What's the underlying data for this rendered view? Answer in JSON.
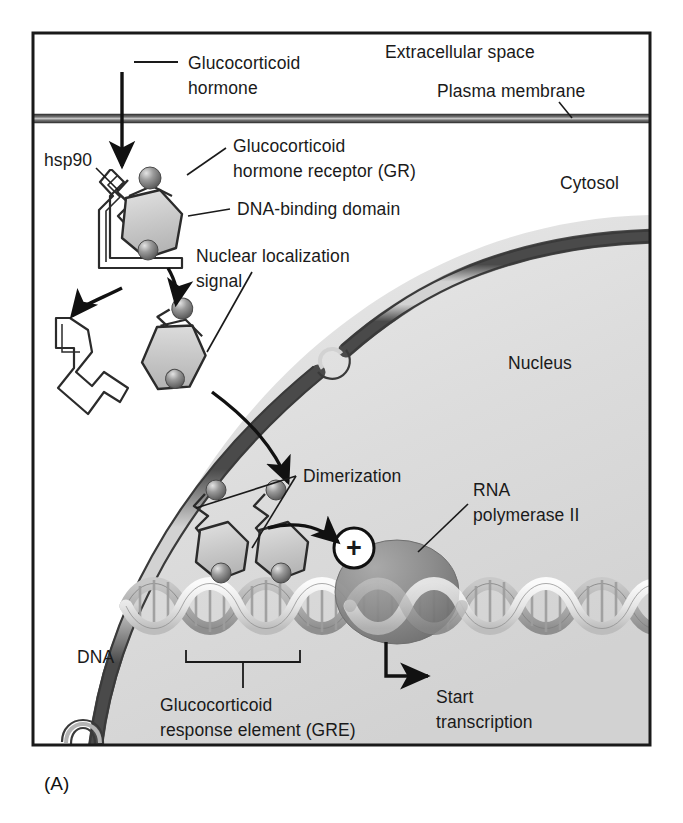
{
  "figure": {
    "panel_label": "(A)",
    "title_semantic": "glucocorticoid-receptor-signaling-pathway"
  },
  "labels": {
    "extracellular_space": "Extracellular space",
    "plasma_membrane": "Plasma membrane",
    "hormone_line1": "Glucocorticoid",
    "hormone_line2": "hormone",
    "hsp90": "hsp90",
    "receptor_line1": "Glucocorticoid",
    "receptor_line2": "hormone receptor (GR)",
    "dna_binding_domain": "DNA-binding domain",
    "nls_line1": "Nuclear localization",
    "nls_line2": "signal",
    "cytosol": "Cytosol",
    "nucleus": "Nucleus",
    "dimerization": "Dimerization",
    "rna_pol_line1": "RNA",
    "rna_pol_line2": "polymerase II",
    "dna": "DNA",
    "gre_line1": "Glucocorticoid",
    "gre_line2": "response element (GRE)",
    "start_line1": "Start",
    "start_line2": "transcription",
    "plus_sign": "+"
  },
  "colors": {
    "frame_border": "#1a1a1a",
    "membrane_dark": "#4a4a4a",
    "membrane_light": "#bdbdbd",
    "nucleus_fill": "#dedede",
    "cytosol_fill": "#ffffff",
    "protein_fill": "#c9c9c9",
    "protein_stroke": "#2b2b2b",
    "sphere_dark": "#6e6e6e",
    "sphere_light": "#d8d8d8",
    "polymerase_fill": "#8c8c8c",
    "dna_light": "#f2f2f2",
    "dna_mid": "#a8a8a8",
    "text": "#1a1a1a"
  },
  "elements": {
    "hormone_sphere": "glucocorticoid-hormone-ligand",
    "receptor_complex": "hsp90-bound-receptor",
    "free_receptor": "activated-receptor",
    "released_hsp90": "dissociated-hsp90",
    "dimer_left": "receptor-monomer-left",
    "dimer_right": "receptor-monomer-right",
    "polymerase": "rna-polymerase-ii",
    "dna_helix": "dna-double-helix",
    "nuclear_envelope": "nuclear-envelope-with-pore"
  }
}
